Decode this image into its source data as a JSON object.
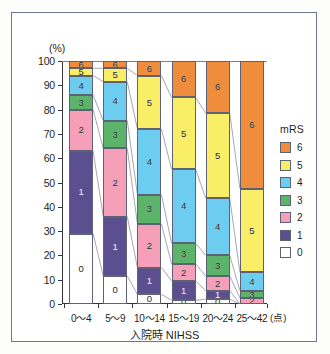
{
  "chart_data": {
    "type": "bar",
    "subtype": "stacked-percentage",
    "title": "",
    "xlabel": "入院時 NIHSS",
    "xunit": "(点)",
    "ylabel": "(%)",
    "ylim": [
      0,
      100
    ],
    "ytick_labels": [
      "0",
      "10",
      "20",
      "30",
      "40",
      "50",
      "60",
      "70",
      "80",
      "90",
      "100"
    ],
    "yticks": [
      0,
      10,
      20,
      30,
      40,
      50,
      60,
      70,
      80,
      90,
      100
    ],
    "grid": false,
    "categories": [
      "0～4",
      "5～9",
      "10～14",
      "15～19",
      "20～24",
      "25～42"
    ],
    "legend_title": "mRS",
    "legend_position": "right",
    "legend_order": [
      "6",
      "5",
      "4",
      "3",
      "2",
      "1",
      "0"
    ],
    "series": [
      {
        "name": "0",
        "label": "0",
        "color": "#ffffff",
        "values": [
          29.0,
          11.5,
          4.0,
          1.5,
          2.0,
          0.0
        ]
      },
      {
        "name": "1",
        "label": "1",
        "color": "#5b4f90",
        "values": [
          34.0,
          24.5,
          11.0,
          8.0,
          3.5,
          0.0
        ]
      },
      {
        "name": "2",
        "label": "2",
        "color": "#f5a0b8",
        "values": [
          17.0,
          28.0,
          18.0,
          7.0,
          6.0,
          2.5
        ]
      },
      {
        "name": "3",
        "label": "3",
        "color": "#5cb36a",
        "values": [
          6.0,
          11.5,
          12.0,
          8.5,
          8.5,
          3.0
        ]
      },
      {
        "name": "4",
        "label": "4",
        "color": "#6ccdf0",
        "values": [
          8.0,
          16.0,
          27.0,
          30.5,
          23.5,
          7.5
        ]
      },
      {
        "name": "5",
        "label": "5",
        "color": "#faee68",
        "values": [
          3.0,
          5.5,
          22.0,
          29.5,
          35.0,
          34.5
        ]
      },
      {
        "name": "6",
        "label": "6",
        "color": "#ef8d3c",
        "values": [
          3.0,
          3.0,
          6.0,
          15.0,
          21.5,
          52.5
        ]
      }
    ],
    "stack_tops": {
      "0~4": {
        "0": 29.0,
        "1": 63.0,
        "2": 80.0,
        "3": 86.0,
        "4": 94.0,
        "5": 97.0,
        "6": 100.0
      },
      "5~9": {
        "0": 11.5,
        "1": 36.0,
        "2": 64.0,
        "3": 75.5,
        "4": 91.5,
        "5": 97.0,
        "6": 100.0
      },
      "10~14": {
        "0": 4.0,
        "1": 15.0,
        "2": 33.0,
        "3": 45.0,
        "4": 72.0,
        "5": 94.0,
        "6": 100.0
      },
      "15~19": {
        "0": 1.5,
        "1": 9.5,
        "2": 16.5,
        "3": 25.0,
        "4": 55.5,
        "5": 85.0,
        "6": 100.0
      },
      "20~24": {
        "0": 2.0,
        "1": 5.5,
        "2": 11.5,
        "3": 20.0,
        "4": 43.5,
        "5": 78.5,
        "6": 100.0
      },
      "25~42": {
        "0": 0.0,
        "1": 0.0,
        "2": 2.5,
        "3": 5.5,
        "4": 13.0,
        "5": 47.5,
        "6": 100.0
      }
    }
  },
  "style": {
    "frame_border": "#6f7792",
    "axis_color": "#33353c",
    "segment_border": "#5d6275",
    "connector_color": "#7c8099",
    "background": "#ffffff"
  }
}
